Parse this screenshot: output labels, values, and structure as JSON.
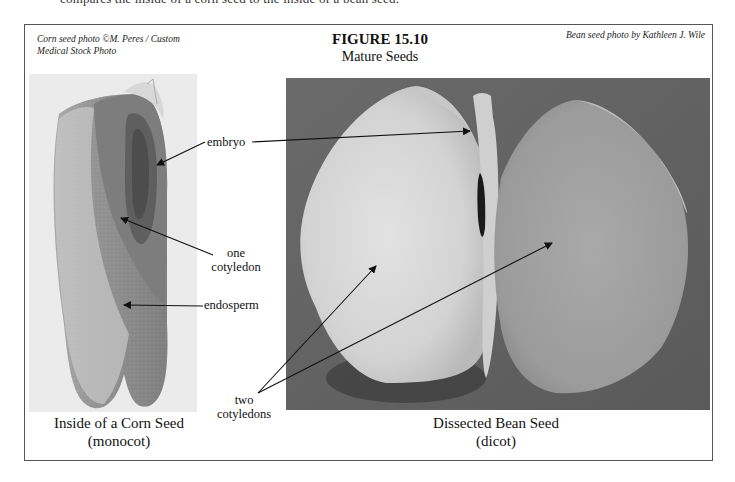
{
  "page": {
    "top_cut_text": "compares the inside of a corn seed to the inside of a bean seed."
  },
  "figure": {
    "number": "FIGURE 15.10",
    "title": "Mature Seeds",
    "credit_left_line1": "Corn seed photo ©M. Peres / Custom",
    "credit_left_line2": "Medical Stock Photo",
    "credit_right": "Bean seed photo by Kathleen J. Wile"
  },
  "labels": {
    "embryo": "embryo",
    "one_cotyledon_line1": "one",
    "one_cotyledon_line2": "cotyledon",
    "endosperm": "endosperm",
    "two_cotyledons_line1": "two",
    "two_cotyledons_line2": "cotyledons"
  },
  "captions": {
    "corn_line1": "Inside of a Corn Seed",
    "corn_line2": "(monocot)",
    "bean_line1": "Dissected Bean Seed",
    "bean_line2": "(dicot)"
  },
  "colors": {
    "frame_border": "#555555",
    "arrow": "#111111",
    "bean_background": "#6d6d6d"
  }
}
